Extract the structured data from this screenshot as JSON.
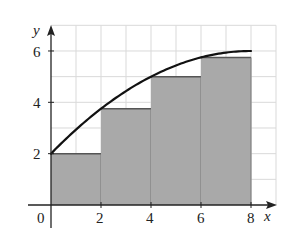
{
  "chart_data": {
    "type": "bar",
    "subtype": "left-endpoint riemann sum with curve",
    "title": "",
    "xlabel": "x",
    "ylabel": "y",
    "xlim": [
      0,
      9
    ],
    "ylim": [
      0,
      7
    ],
    "grid": true,
    "grid_step": 1,
    "x_ticks": [
      0,
      2,
      4,
      6,
      8
    ],
    "y_ticks": [
      2,
      4,
      6
    ],
    "x_tick_labels": [
      "0",
      "2",
      "4",
      "6",
      "8"
    ],
    "y_tick_labels": [
      "2",
      "4",
      "6"
    ],
    "bars": [
      {
        "x_start": 0,
        "x_end": 2,
        "height": 2
      },
      {
        "x_start": 2,
        "x_end": 4,
        "height": 3.75
      },
      {
        "x_start": 4,
        "x_end": 6,
        "height": 5
      },
      {
        "x_start": 6,
        "x_end": 8,
        "height": 5.75
      }
    ],
    "curve": {
      "description": "increasing concave-down curve through bar top-left corners",
      "x": [
        0,
        1,
        2,
        3,
        4,
        5,
        6,
        7,
        8
      ],
      "y": [
        2,
        2.9375,
        3.75,
        4.4375,
        5,
        5.4375,
        5.75,
        5.9375,
        6
      ]
    },
    "colors": {
      "bar_fill": "#a9a9a9",
      "bar_edge": "#555555",
      "grid": "#d9d9d9",
      "curve": "#111111",
      "axis": "#222222"
    },
    "legend": null
  },
  "labels": {
    "x_axis": "x",
    "y_axis": "y",
    "origin": "0",
    "x2": "2",
    "x4": "4",
    "x6": "6",
    "x8": "8",
    "y2": "2",
    "y4": "4",
    "y6": "6"
  }
}
